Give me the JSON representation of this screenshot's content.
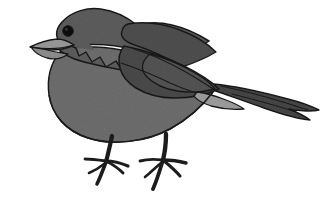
{
  "image": {
    "subject": "bird",
    "title": "Perched songbird illustration",
    "orientation": "facing left",
    "style": "grayscale line illustration with flat tonal fills and black outlines",
    "background_color": "#ffffff",
    "width": 333,
    "height": 206
  },
  "palette": {
    "background": "#ffffff",
    "outline": "#1a1a1a",
    "cap_dark_gray": "#5d5d5d",
    "wing_dark_gray": "#4a4a4a",
    "tail_dark_gray": "#464646",
    "body_mid_gray": "#737373",
    "breast_gray": "#6e6e6e",
    "beak_light_gray": "#9a9a9a",
    "covert_light_gray": "#9e9e9e",
    "eye_black": "#111111",
    "leg_black": "#1c1c1c"
  },
  "parts": [
    {
      "name": "head-cap",
      "label": "Head / crown",
      "color": "#5d5d5d"
    },
    {
      "name": "eye",
      "label": "Eye",
      "color": "#111111"
    },
    {
      "name": "beak",
      "label": "Beak",
      "color": "#9a9a9a"
    },
    {
      "name": "throat",
      "label": "Throat",
      "color": "#5d5d5d"
    },
    {
      "name": "breast",
      "label": "Breast and belly",
      "color": "#6e6e6e"
    },
    {
      "name": "back",
      "label": "Back / mantle",
      "color": "#4f4f4f"
    },
    {
      "name": "wing",
      "label": "Folded wing",
      "color": "#4a4a4a"
    },
    {
      "name": "wing-covert",
      "label": "Wing coverts",
      "color": "#545454"
    },
    {
      "name": "undertail-covert",
      "label": "Undertail covert patch",
      "color": "#9e9e9e"
    },
    {
      "name": "tail",
      "label": "Tail feathers",
      "color": "#464646"
    },
    {
      "name": "leg-front",
      "label": "Front leg and foot",
      "color": "#1c1c1c"
    },
    {
      "name": "leg-back",
      "label": "Rear leg and foot",
      "color": "#1c1c1c"
    }
  ],
  "caption": ""
}
